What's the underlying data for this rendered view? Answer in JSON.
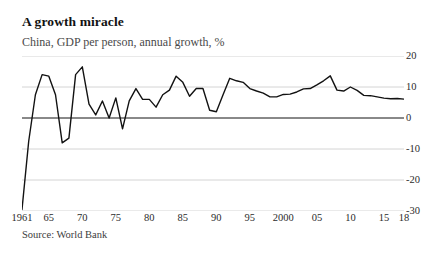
{
  "header": {
    "title": "A growth miracle",
    "subtitle": "China, GDP per person, annual growth, %"
  },
  "footer": {
    "source": "Source: World Bank"
  },
  "colors": {
    "line": "#121212",
    "grid": "#c9c9c9",
    "zero_axis": "#121212",
    "text": "#121212",
    "subtitle_text": "#4a4a4a"
  },
  "chart_data": {
    "type": "line",
    "title": "A growth miracle",
    "subtitle": "China, GDP per person, annual growth, %",
    "xlabel": "",
    "ylabel": "",
    "ylim": [
      -30,
      20
    ],
    "yticks": [
      20,
      10,
      0,
      -10,
      -20,
      -30
    ],
    "ytick_labels": [
      "20",
      "10",
      "0",
      "-10",
      "-20",
      "-30"
    ],
    "grid": true,
    "grid_axis": "y",
    "legend": "none",
    "xtick_values": [
      1961,
      1965,
      1970,
      1975,
      1980,
      1985,
      1990,
      1995,
      2000,
      2005,
      2010,
      2015,
      2018
    ],
    "xtick_labels": [
      "1961",
      "65",
      "70",
      "75",
      "80",
      "85",
      "90",
      "95",
      "2000",
      "05",
      "10",
      "15",
      "18"
    ],
    "xlim": [
      1961,
      2018
    ],
    "series": [
      {
        "name": "China, GDP per person, annual growth, %",
        "x": [
          1961,
          1962,
          1963,
          1964,
          1965,
          1966,
          1967,
          1968,
          1969,
          1970,
          1971,
          1972,
          1973,
          1974,
          1975,
          1976,
          1977,
          1978,
          1979,
          1980,
          1981,
          1982,
          1983,
          1984,
          1985,
          1986,
          1987,
          1988,
          1989,
          1990,
          1991,
          1992,
          1993,
          1994,
          1995,
          1996,
          1997,
          1998,
          1999,
          2000,
          2001,
          2002,
          2003,
          2004,
          2005,
          2006,
          2007,
          2008,
          2009,
          2010,
          2011,
          2012,
          2013,
          2014,
          2015,
          2016,
          2017,
          2018
        ],
        "values": [
          -29.5,
          -7.5,
          7.5,
          14.0,
          13.5,
          7.5,
          -8.0,
          -6.5,
          14.0,
          16.5,
          4.5,
          1.0,
          5.5,
          0.0,
          6.5,
          -3.5,
          5.5,
          9.5,
          6.0,
          6.0,
          3.5,
          7.5,
          9.0,
          13.5,
          11.5,
          7.0,
          9.5,
          9.5,
          2.5,
          2.0,
          7.5,
          12.8,
          12.0,
          11.5,
          9.5,
          8.7,
          8.0,
          6.8,
          6.8,
          7.6,
          7.7,
          8.4,
          9.4,
          9.5,
          10.7,
          12.0,
          13.6,
          9.0,
          8.7,
          10.0,
          8.9,
          7.3,
          7.2,
          6.8,
          6.4,
          6.2,
          6.3,
          6.1
        ]
      }
    ]
  }
}
